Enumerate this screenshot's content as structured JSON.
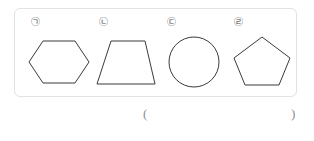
{
  "panel": {
    "name": "figure-panel",
    "border_color": "#e2e2e4",
    "figures": [
      {
        "label": "㉠",
        "label_letter": "ㄱ",
        "shape": "hexagon",
        "shape_name": "regular-hexagon",
        "stroke_color": "#3a3a3a"
      },
      {
        "label": "㉡",
        "label_letter": "ㄴ",
        "shape": "trapezoid",
        "shape_name": "isosceles-trapezoid",
        "stroke_color": "#3a3a3a"
      },
      {
        "label": "㉢",
        "label_letter": "ㄷ",
        "shape": "circle",
        "shape_name": "circle",
        "stroke_color": "#3a3a3a"
      },
      {
        "label": "㉣",
        "label_letter": "ㄹ",
        "shape": "pentagon",
        "shape_name": "regular-pentagon",
        "stroke_color": "#3a3a3a"
      }
    ]
  },
  "answer": {
    "open_paren": "(",
    "close_paren": ")",
    "value": ""
  }
}
